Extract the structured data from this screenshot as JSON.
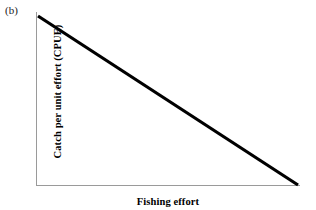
{
  "panel": {
    "label": "(b)"
  },
  "chart_data": {
    "type": "line",
    "title": "",
    "subtitle": "",
    "panel_label": "(b)",
    "xlabel": "Fishing effort",
    "ylabel": "Catch per unit effort (CPUE)",
    "xlim": [
      0,
      1
    ],
    "ylim": [
      0,
      1
    ],
    "xticks": [],
    "yticks": [],
    "xticklabels": [],
    "yticklabels": [],
    "grid": false,
    "legend": null,
    "annotations": [],
    "series": [
      {
        "name": "CPUE vs effort",
        "x": [
          0,
          1
        ],
        "y": [
          1,
          0
        ],
        "color": "#000000",
        "linewidth": 3.2,
        "style": "solid"
      }
    ]
  },
  "style": {
    "background": "#ffffff",
    "axis_color": "#9a9a9a",
    "line_color": "#000000",
    "text_color": "#000000"
  }
}
